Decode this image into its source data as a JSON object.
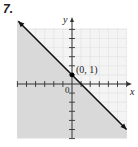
{
  "problem_number": "7.",
  "chart_data": {
    "type": "line",
    "title": "",
    "xlabel": "x",
    "ylabel": "y",
    "xlim": [
      -6,
      6
    ],
    "ylim": [
      -6,
      6
    ],
    "grid": true,
    "series": [
      {
        "name": "boundary line y = -x + 1",
        "style": "solid",
        "x": [
          -6,
          6
        ],
        "y": [
          7,
          -5
        ],
        "arrows": "both"
      }
    ],
    "shaded_region": "below line (y <= -x + 1)",
    "points": [
      {
        "x": 0,
        "y": 1,
        "label": "(0, 1)"
      }
    ],
    "annotations": [
      {
        "text": "(0, 1)",
        "x": 0,
        "y": 1
      },
      {
        "text": "0",
        "x": 0,
        "y": 0
      }
    ],
    "colors": {
      "shade": "#d4d4d4",
      "grid": "#e8e8e8",
      "line": "#1a1a1a"
    }
  },
  "labels": {
    "x_axis": "x",
    "y_axis": "y",
    "origin": "0",
    "point": "(0, 1)"
  }
}
